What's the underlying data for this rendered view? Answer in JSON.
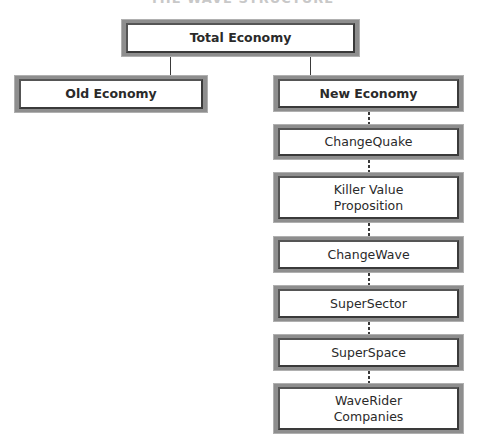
{
  "title": "THE WAVE STRUCTURE",
  "root": {
    "label": "Total Economy"
  },
  "branches": [
    {
      "label": "Old Economy"
    },
    {
      "label": "New Economy"
    }
  ],
  "chain": [
    {
      "label": "ChangeQuake"
    },
    {
      "label": "Killer Value\nProposition"
    },
    {
      "label": "ChangeWave"
    },
    {
      "label": "SuperSector"
    },
    {
      "label": "SuperSpace"
    },
    {
      "label": "WaveRider\nCompanies"
    }
  ]
}
